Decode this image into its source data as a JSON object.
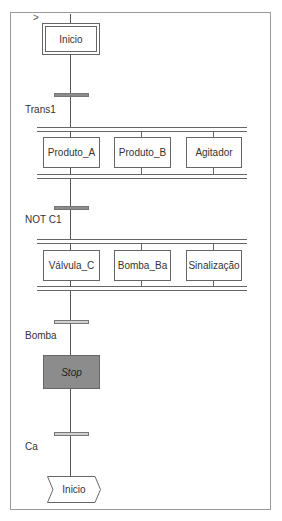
{
  "diagram": {
    "type": "SFC",
    "initial_step": {
      "label": "Inicio",
      "initial_marker": ">"
    },
    "transitions": [
      {
        "label": "Trans1",
        "style": "dark"
      },
      {
        "label": "NOT C1",
        "style": "dark"
      },
      {
        "label": "Bomba",
        "style": "light"
      },
      {
        "label": "Ca",
        "style": "light"
      }
    ],
    "parallel_branch_1": {
      "steps": [
        "Produto_A",
        "Produto_B",
        "Agitador"
      ]
    },
    "parallel_branch_2": {
      "steps": [
        "Válvula_C",
        "Bomba_Ba",
        "Sinalização"
      ]
    },
    "stop_step": {
      "label": "Stop"
    },
    "jump": {
      "label": "Inicio"
    },
    "colors": {
      "line": "#555555",
      "active_step": "#8c8c8c",
      "transition_dark": "#8c8c8c",
      "transition_light": "#d0d0d0"
    }
  }
}
